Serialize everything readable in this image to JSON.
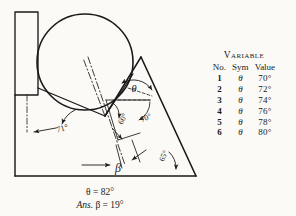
{
  "figure": {
    "labels": {
      "theta": "θ",
      "beta": "β",
      "angle_left": "71°",
      "angle_inner_left": "60°",
      "angle_inner_right": "70°",
      "angle_base_right": "65°"
    },
    "colors": {
      "ink": "#1a1a1a",
      "paper": "#fbfaf6"
    }
  },
  "table": {
    "title": "Variable",
    "columns": [
      "No.",
      "Sym",
      "Value"
    ],
    "rows": [
      {
        "no": "1",
        "sym": "θ",
        "value": "70°"
      },
      {
        "no": "2",
        "sym": "θ",
        "value": "72°"
      },
      {
        "no": "3",
        "sym": "θ",
        "value": "74°"
      },
      {
        "no": "4",
        "sym": "θ",
        "value": "76°"
      },
      {
        "no": "5",
        "sym": "θ",
        "value": "78°"
      },
      {
        "no": "6",
        "sym": "θ",
        "value": "80°"
      }
    ]
  },
  "caption": {
    "line1": "θ = 82°",
    "line2_prefix": "Ans.",
    "line2_rest": "β = 19°"
  }
}
